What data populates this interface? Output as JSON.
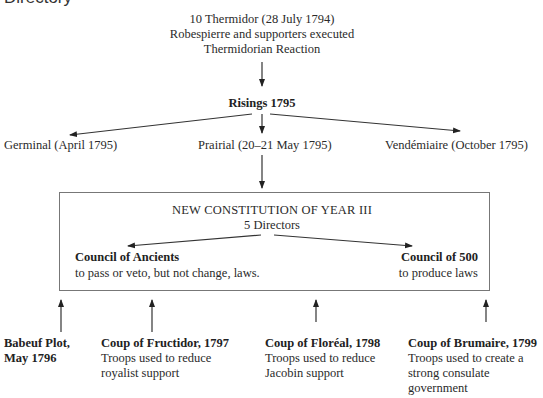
{
  "heading_cut": "Directory",
  "top": {
    "line1": "10 Thermidor (28 July 1794)",
    "line2": "Robespierre and supporters executed",
    "line3": "Thermidorian Reaction"
  },
  "risings": {
    "title": "Risings 1795",
    "branches": [
      {
        "label": "Germinal (April 1795)"
      },
      {
        "label": "Prairial (20–21 May 1795)"
      },
      {
        "label": "Vendémiaire (October 1795)"
      }
    ]
  },
  "constitution": {
    "title": "NEW CONSTITUTION OF YEAR III",
    "subtitle": "5 Directors",
    "ancients": {
      "title": "Council of Ancients",
      "desc": "to pass or veto, but not change, laws."
    },
    "five_hundred": {
      "title": "Council of 500",
      "desc": "to produce laws"
    }
  },
  "events": [
    {
      "title": "Babeuf Plot,",
      "title2": "May 1796"
    },
    {
      "title": "Coup of Fructidor, 1797",
      "lines": [
        "Troops used to reduce",
        "royalist support"
      ]
    },
    {
      "title": "Coup of Floréal, 1798",
      "lines": [
        "Troops used to reduce",
        "Jacobin support"
      ]
    },
    {
      "title": "Coup of Brumaire, 1799",
      "lines": [
        "Troops used to create a",
        "strong consulate",
        "government"
      ]
    }
  ]
}
